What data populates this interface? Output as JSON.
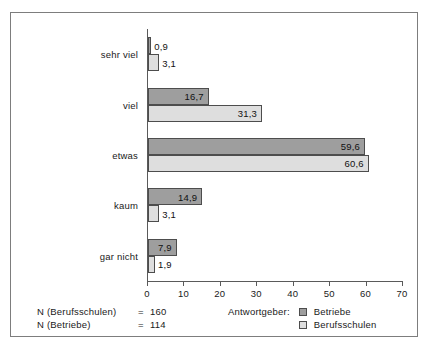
{
  "chart_data": {
    "type": "bar",
    "orientation": "horizontal",
    "title": "",
    "xlabel": "",
    "ylabel": "",
    "categories": [
      "sehr viel",
      "viel",
      "etwas",
      "kaum",
      "gar nicht"
    ],
    "series": [
      {
        "name": "Betriebe",
        "color": "#9e9e9e",
        "values": [
          0.9,
          16.7,
          59.6,
          14.9,
          7.9
        ],
        "labels": [
          "0,9",
          "16,7",
          "59,6",
          "14,9",
          "7,9"
        ]
      },
      {
        "name": "Berufsschulen",
        "color": "#dedede",
        "values": [
          3.1,
          31.3,
          60.6,
          3.1,
          1.9
        ],
        "labels": [
          "3,1",
          "31,3",
          "60,6",
          "3,1",
          "1,9"
        ]
      }
    ],
    "xlim": [
      0,
      70
    ],
    "xticks": [
      0,
      10,
      20,
      30,
      40,
      50,
      60,
      70
    ],
    "xticklabels": [
      "0",
      "10",
      "20",
      "30",
      "40",
      "50",
      "60",
      "70"
    ],
    "grid": false,
    "legend_position": "bottom-right"
  },
  "legend": {
    "title": "Antwortgeber:",
    "items": [
      {
        "label": "Betriebe",
        "swatch": "dark"
      },
      {
        "label": "Berufsschulen",
        "swatch": "light"
      }
    ]
  },
  "notes": [
    {
      "name": "N (Berufsschulen)",
      "eq": "=",
      "value": "160"
    },
    {
      "name": "N (Betriebe)",
      "eq": "=",
      "value": "114"
    }
  ],
  "colors": {
    "betriebe": "#9e9e9e",
    "berufsschulen": "#dedede",
    "axis": "#5a5a5a",
    "frame": "#7d7d7d",
    "text": "#1a1a1a"
  }
}
